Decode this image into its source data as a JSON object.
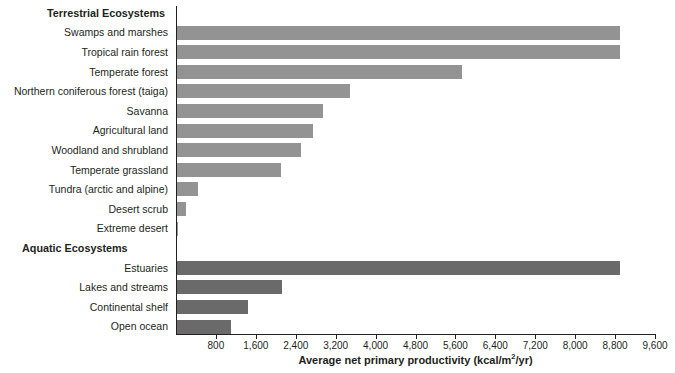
{
  "chart_data": {
    "type": "bar",
    "orientation": "horizontal",
    "title": "",
    "xlabel": "Average net primary productivity (kcal/m2/yr)",
    "xlabel_parts": {
      "before_sup": "Average net primary productivity (kcal/m",
      "sup": "2",
      "after_sup": "/yr)"
    },
    "ylabel": "",
    "xlim": [
      0,
      9600
    ],
    "xticks": [
      800,
      1600,
      2400,
      3200,
      4000,
      4800,
      5600,
      6400,
      7200,
      8000,
      8800,
      9600
    ],
    "xtick_labels": [
      "800",
      "1,600",
      "2,400",
      "3,200",
      "4,000",
      "4,800",
      "5,600",
      "6,400",
      "7,200",
      "8,000",
      "8,800",
      "9,600"
    ],
    "grid": false,
    "legend": false,
    "group_headers": [
      "Terrestrial Ecosystems",
      "Aquatic Ecosystems"
    ],
    "series": [
      {
        "name": "Terrestrial Ecosystems",
        "color": "#939393",
        "categories": [
          "Swamps and marshes",
          "Tropical rain forest",
          "Temperate forest",
          "Northern coniferous forest (taiga)",
          "Savanna",
          "Agricultural land",
          "Woodland and shrubland",
          "Temperate grassland",
          "Tundra (arctic and alpine)",
          "Desert scrub",
          "Extreme desert"
        ],
        "values": [
          8900,
          8900,
          5725,
          3490,
          2950,
          2750,
          2500,
          2100,
          450,
          200,
          40
        ]
      },
      {
        "name": "Aquatic Ecosystems",
        "color": "#6a6a6a",
        "categories": [
          "Estuaries",
          "Lakes and streams",
          "Continental shelf",
          "Open ocean"
        ],
        "values": [
          8900,
          2120,
          1450,
          1100
        ]
      }
    ],
    "rows": [
      {
        "kind": "group",
        "label": "Terrestrial Ecosystems"
      },
      {
        "kind": "bar",
        "label": "Swamps and marshes",
        "value": 8900,
        "group": "terrestrial"
      },
      {
        "kind": "bar",
        "label": "Tropical rain forest",
        "value": 8900,
        "group": "terrestrial"
      },
      {
        "kind": "bar",
        "label": "Temperate forest",
        "value": 5725,
        "group": "terrestrial"
      },
      {
        "kind": "bar",
        "label": "Northern coniferous forest (taiga)",
        "value": 3490,
        "group": "terrestrial"
      },
      {
        "kind": "bar",
        "label": "Savanna",
        "value": 2950,
        "group": "terrestrial"
      },
      {
        "kind": "bar",
        "label": "Agricultural land",
        "value": 2750,
        "group": "terrestrial"
      },
      {
        "kind": "bar",
        "label": "Woodland and shrubland",
        "value": 2500,
        "group": "terrestrial"
      },
      {
        "kind": "bar",
        "label": "Temperate grassland",
        "value": 2100,
        "group": "terrestrial"
      },
      {
        "kind": "bar",
        "label": "Tundra (arctic and alpine)",
        "value": 450,
        "group": "terrestrial"
      },
      {
        "kind": "bar",
        "label": "Desert scrub",
        "value": 200,
        "group": "terrestrial"
      },
      {
        "kind": "bar",
        "label": "Extreme desert",
        "value": 40,
        "group": "terrestrial"
      },
      {
        "kind": "group",
        "label": "Aquatic Ecosystems"
      },
      {
        "kind": "bar",
        "label": "Estuaries",
        "value": 8900,
        "group": "aquatic"
      },
      {
        "kind": "bar",
        "label": "Lakes and streams",
        "value": 2120,
        "group": "aquatic"
      },
      {
        "kind": "bar",
        "label": "Continental shelf",
        "value": 1450,
        "group": "aquatic"
      },
      {
        "kind": "bar",
        "label": "Open ocean",
        "value": 1100,
        "group": "aquatic"
      }
    ]
  },
  "colors": {
    "terrestrial_bar": "#939393",
    "aquatic_bar": "#6a6a6a",
    "axis": "#231f20",
    "text": "#231f20",
    "background": "#ffffff"
  }
}
